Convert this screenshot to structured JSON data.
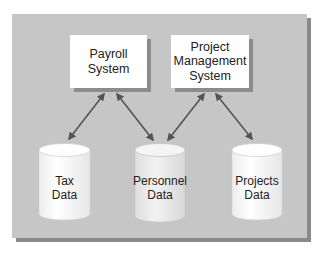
{
  "diagram": {
    "colors": {
      "panel": "#c6c6c6",
      "panel_shadow": "#8a8a8a",
      "box_fill": "#ffffff",
      "box_shadow": "#8c8c8c",
      "arrow": "#555555",
      "text": "#222222"
    },
    "systems": [
      {
        "id": "payroll",
        "line1": "Payroll",
        "line2": "System",
        "line3": ""
      },
      {
        "id": "project_mgmt",
        "line1": "Project",
        "line2": "Management",
        "line3": "System"
      }
    ],
    "data_stores": [
      {
        "id": "tax",
        "line1": "Tax",
        "line2": "Data"
      },
      {
        "id": "personnel",
        "line1": "Personnel",
        "line2": "Data"
      },
      {
        "id": "projects",
        "line1": "Projects",
        "line2": "Data"
      }
    ],
    "connections": [
      {
        "from": "Payroll System",
        "to": "Tax Data",
        "type": "bidirectional"
      },
      {
        "from": "Payroll System",
        "to": "Personnel Data",
        "type": "bidirectional"
      },
      {
        "from": "Project Management System",
        "to": "Personnel Data",
        "type": "bidirectional"
      },
      {
        "from": "Project Management System",
        "to": "Projects Data",
        "type": "bidirectional"
      }
    ]
  }
}
